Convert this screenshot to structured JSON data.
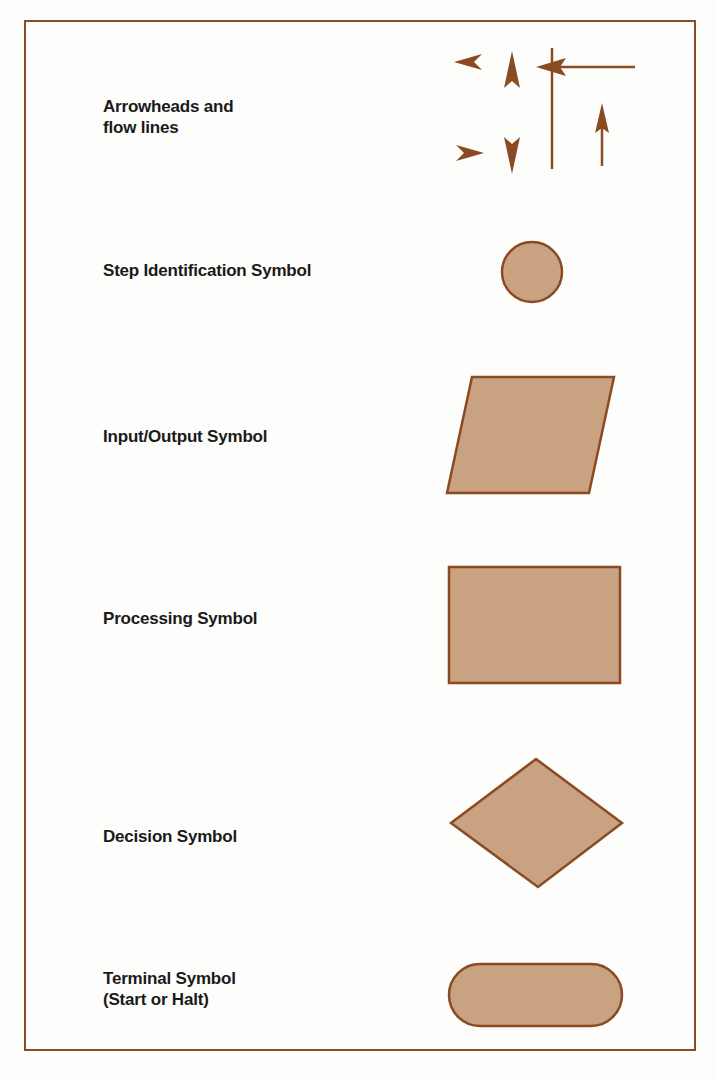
{
  "colors": {
    "border": "#8a4a22",
    "stroke": "#8a4a22",
    "fill": "#c9a282",
    "arrow": "#8a4a22",
    "text": "#1a1a1a",
    "background": "#fdfdfb"
  },
  "symbols": [
    {
      "id": "arrowheads",
      "label_line1": "Arrowheads and",
      "label_line2": "flow lines",
      "shape": "arrows-and-lines"
    },
    {
      "id": "step",
      "label_line1": "Step Identification Symbol",
      "shape": "circle"
    },
    {
      "id": "io",
      "label_line1": "Input/Output Symbol",
      "shape": "parallelogram"
    },
    {
      "id": "processing",
      "label_line1": "Processing Symbol",
      "shape": "rectangle"
    },
    {
      "id": "decision",
      "label_line1": "Decision Symbol",
      "shape": "diamond"
    },
    {
      "id": "terminal",
      "label_line1": "Terminal Symbol",
      "label_line2": "(Start or Halt)",
      "shape": "rounded-rectangle"
    }
  ]
}
